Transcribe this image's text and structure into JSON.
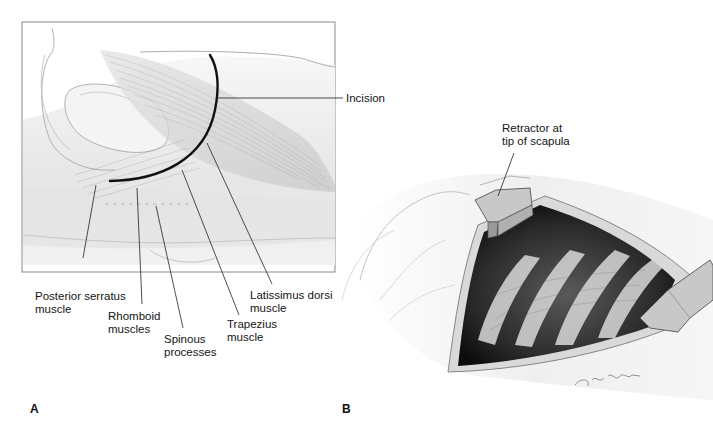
{
  "figure": {
    "panels": [
      {
        "id": "A",
        "letter": "A",
        "labels": {
          "incision": "Incision",
          "posterior_serratus": "Posterior serratus\nmuscle",
          "rhomboid": "Rhomboid\nmuscles",
          "spinous": "Spinous\nprocesses",
          "trapezius": "Trapezius\nmuscle",
          "latissimus": "Latissimus dorsi\nmuscle"
        }
      },
      {
        "id": "B",
        "letter": "B",
        "labels": {
          "retractor": "Retractor at\ntip of scapula"
        },
        "signature": "© Jn Williams"
      }
    ],
    "colors": {
      "outline": "#8a8a8a",
      "incision_line": "#111111",
      "leader_line": "#222222",
      "cavity_dark": "#1c1c1c",
      "rib_light": "#d8d8d8",
      "retractor_fill": "#c8c8c8",
      "skin": "#ececec"
    }
  }
}
